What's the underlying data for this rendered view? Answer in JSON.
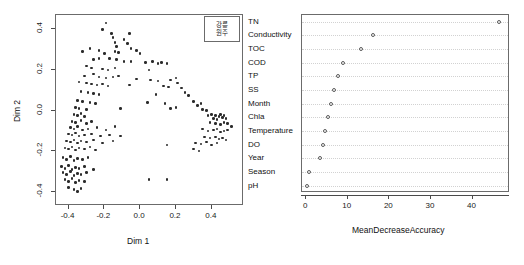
{
  "figure": {
    "background": "#ffffff",
    "point_color": "#2b2b2b",
    "frame_color": "#6b6b6b"
  },
  "chart_data": [
    {
      "type": "scatter",
      "title": "",
      "xlabel": "Dim 1",
      "ylabel": "Dim 2",
      "xlim": [
        -0.47,
        0.58
      ],
      "ylim": [
        -0.47,
        0.47
      ],
      "xticks": [
        -0.4,
        -0.2,
        0.0,
        0.2,
        0.4
      ],
      "xticklabels": [
        "-0.4",
        "-0.2",
        "0.0",
        "0.2",
        "0.4"
      ],
      "yticks": [
        -0.4,
        -0.2,
        0.0,
        0.2,
        0.4
      ],
      "yticklabels": [
        "-0.4",
        "-0.2",
        "0.0",
        "0.2",
        "0.4"
      ],
      "grid": false,
      "legend_position": "top-right",
      "legend_entries": [
        "강릉",
        "원주"
      ],
      "points": [
        [
          -0.185,
          0.425
        ],
        [
          -0.205,
          0.395
        ],
        [
          -0.155,
          0.375
        ],
        [
          -0.055,
          0.375
        ],
        [
          -0.145,
          0.355
        ],
        [
          -0.085,
          0.345
        ],
        [
          -0.135,
          0.33
        ],
        [
          -0.065,
          0.325
        ],
        [
          -0.125,
          0.31
        ],
        [
          -0.275,
          0.3
        ],
        [
          -0.315,
          0.285
        ],
        [
          -0.225,
          0.29
        ],
        [
          -0.135,
          0.285
        ],
        [
          -0.115,
          0.28
        ],
        [
          -0.195,
          0.275
        ],
        [
          -0.045,
          0.3
        ],
        [
          -0.015,
          0.29
        ],
        [
          0.005,
          0.275
        ],
        [
          -0.255,
          0.245
        ],
        [
          -0.225,
          0.25
        ],
        [
          -0.165,
          0.25
        ],
        [
          -0.125,
          0.245
        ],
        [
          -0.085,
          0.235
        ],
        [
          -0.045,
          0.235
        ],
        [
          0.035,
          0.23
        ],
        [
          0.075,
          0.235
        ],
        [
          0.105,
          0.225
        ],
        [
          0.125,
          0.23
        ],
        [
          0.155,
          0.225
        ],
        [
          -0.295,
          0.215
        ],
        [
          -0.265,
          0.205
        ],
        [
          -0.205,
          0.2
        ],
        [
          -0.175,
          0.195
        ],
        [
          -0.135,
          0.205
        ],
        [
          0.055,
          0.195
        ],
        [
          -0.305,
          0.165
        ],
        [
          -0.255,
          0.175
        ],
        [
          -0.225,
          0.16
        ],
        [
          -0.185,
          0.155
        ],
        [
          -0.145,
          0.16
        ],
        [
          -0.115,
          0.165
        ],
        [
          -0.015,
          0.15
        ],
        [
          0.065,
          0.145
        ],
        [
          0.105,
          0.14
        ],
        [
          0.175,
          0.145
        ],
        [
          0.205,
          0.155
        ],
        [
          0.215,
          0.13
        ],
        [
          -0.335,
          0.135
        ],
        [
          -0.295,
          0.13
        ],
        [
          -0.265,
          0.125
        ],
        [
          -0.235,
          0.12
        ],
        [
          -0.205,
          0.125
        ],
        [
          -0.175,
          0.115
        ],
        [
          -0.055,
          0.12
        ],
        [
          0.135,
          0.115
        ],
        [
          0.165,
          0.11
        ],
        [
          0.235,
          0.105
        ],
        [
          -0.325,
          0.09
        ],
        [
          -0.285,
          0.085
        ],
        [
          -0.255,
          0.08
        ],
        [
          -0.225,
          0.075
        ],
        [
          0.095,
          0.075
        ],
        [
          0.255,
          0.085
        ],
        [
          0.275,
          0.07
        ],
        [
          -0.345,
          0.045
        ],
        [
          -0.315,
          0.04
        ],
        [
          -0.275,
          0.035
        ],
        [
          -0.245,
          0.03
        ],
        [
          0.045,
          0.035
        ],
        [
          0.145,
          0.03
        ],
        [
          0.305,
          0.04
        ],
        [
          0.325,
          0.02
        ],
        [
          0.345,
          0.03
        ],
        [
          -0.355,
          0.01
        ],
        [
          -0.335,
          0.005
        ],
        [
          -0.295,
          0.0
        ],
        [
          -0.105,
          0.005
        ],
        [
          0.175,
          0.005
        ],
        [
          0.205,
          0.01
        ],
        [
          0.355,
          0.0
        ],
        [
          0.375,
          -0.005
        ],
        [
          -0.365,
          -0.025
        ],
        [
          -0.345,
          -0.03
        ],
        [
          -0.325,
          -0.02
        ],
        [
          -0.305,
          -0.035
        ],
        [
          0.385,
          -0.03
        ],
        [
          0.405,
          -0.025
        ],
        [
          0.425,
          -0.03
        ],
        [
          0.445,
          -0.035
        ],
        [
          0.455,
          -0.025
        ],
        [
          0.465,
          -0.04
        ],
        [
          0.475,
          -0.03
        ],
        [
          0.485,
          -0.045
        ],
        [
          0.435,
          -0.05
        ],
        [
          0.415,
          -0.045
        ],
        [
          -0.375,
          -0.06
        ],
        [
          -0.355,
          -0.065
        ],
        [
          -0.325,
          -0.055
        ],
        [
          -0.295,
          -0.07
        ],
        [
          -0.265,
          -0.06
        ],
        [
          0.395,
          -0.065
        ],
        [
          0.425,
          -0.07
        ],
        [
          0.455,
          -0.075
        ],
        [
          0.475,
          -0.065
        ],
        [
          0.495,
          -0.07
        ],
        [
          0.515,
          -0.085
        ],
        [
          -0.385,
          -0.09
        ],
        [
          -0.365,
          -0.095
        ],
        [
          -0.345,
          -0.085
        ],
        [
          -0.315,
          -0.1
        ],
        [
          -0.285,
          -0.095
        ],
        [
          -0.235,
          -0.09
        ],
        [
          -0.185,
          -0.1
        ],
        [
          -0.135,
          -0.085
        ],
        [
          0.355,
          -0.095
        ],
        [
          0.385,
          -0.105
        ],
        [
          0.415,
          -0.1
        ],
        [
          0.435,
          -0.095
        ],
        [
          0.455,
          -0.11
        ],
        [
          0.475,
          -0.105
        ],
        [
          0.495,
          -0.1
        ],
        [
          -0.395,
          -0.12
        ],
        [
          -0.375,
          -0.125
        ],
        [
          -0.355,
          -0.115
        ],
        [
          -0.335,
          -0.13
        ],
        [
          -0.305,
          -0.125
        ],
        [
          -0.265,
          -0.12
        ],
        [
          -0.215,
          -0.13
        ],
        [
          -0.165,
          -0.125
        ],
        [
          -0.105,
          -0.13
        ],
        [
          0.365,
          -0.135
        ],
        [
          0.395,
          -0.14
        ],
        [
          0.425,
          -0.135
        ],
        [
          0.445,
          -0.145
        ],
        [
          0.465,
          -0.14
        ],
        [
          0.485,
          -0.15
        ],
        [
          -0.405,
          -0.155
        ],
        [
          -0.385,
          -0.16
        ],
        [
          -0.365,
          -0.15
        ],
        [
          -0.345,
          -0.165
        ],
        [
          -0.325,
          -0.155
        ],
        [
          -0.295,
          -0.16
        ],
        [
          -0.255,
          -0.15
        ],
        [
          -0.205,
          -0.165
        ],
        [
          -0.145,
          -0.155
        ],
        [
          0.155,
          -0.175
        ],
        [
          0.315,
          -0.165
        ],
        [
          0.345,
          -0.17
        ],
        [
          0.375,
          -0.16
        ],
        [
          0.405,
          -0.175
        ],
        [
          0.435,
          -0.165
        ],
        [
          -0.415,
          -0.19
        ],
        [
          -0.395,
          -0.195
        ],
        [
          -0.375,
          -0.185
        ],
        [
          -0.355,
          -0.2
        ],
        [
          -0.335,
          -0.19
        ],
        [
          -0.305,
          -0.195
        ],
        [
          -0.275,
          -0.185
        ],
        [
          -0.245,
          -0.2
        ],
        [
          0.305,
          -0.195
        ],
        [
          0.335,
          -0.205
        ],
        [
          -0.425,
          -0.235
        ],
        [
          -0.405,
          -0.245
        ],
        [
          -0.385,
          -0.23
        ],
        [
          -0.365,
          -0.25
        ],
        [
          -0.345,
          -0.24
        ],
        [
          -0.315,
          -0.245
        ],
        [
          -0.285,
          -0.235
        ],
        [
          -0.435,
          -0.28
        ],
        [
          -0.415,
          -0.29
        ],
        [
          -0.395,
          -0.275
        ],
        [
          -0.375,
          -0.295
        ],
        [
          -0.355,
          -0.285
        ],
        [
          -0.335,
          -0.29
        ],
        [
          -0.305,
          -0.28
        ],
        [
          -0.255,
          -0.295
        ],
        [
          -0.425,
          -0.31
        ],
        [
          -0.405,
          -0.32
        ],
        [
          -0.385,
          -0.305
        ],
        [
          -0.365,
          -0.325
        ],
        [
          -0.345,
          -0.315
        ],
        [
          -0.325,
          -0.32
        ],
        [
          -0.295,
          -0.31
        ],
        [
          0.055,
          -0.345
        ],
        [
          0.155,
          -0.345
        ],
        [
          -0.415,
          -0.345
        ],
        [
          -0.395,
          -0.355
        ],
        [
          -0.375,
          -0.34
        ],
        [
          -0.355,
          -0.36
        ],
        [
          -0.335,
          -0.35
        ],
        [
          -0.305,
          -0.355
        ],
        [
          -0.395,
          -0.385
        ],
        [
          -0.365,
          -0.395
        ],
        [
          -0.345,
          -0.405
        ],
        [
          -0.325,
          -0.39
        ]
      ]
    },
    {
      "type": "dotplot",
      "title": "",
      "xlabel": "MeanDecreaseAccuracy",
      "ylabel": "",
      "xlim": [
        -1.0,
        49.0
      ],
      "xticks": [
        0,
        10,
        20,
        30,
        40
      ],
      "xticklabels": [
        "0",
        "10",
        "20",
        "30",
        "40"
      ],
      "grid": "dotted-horizontal",
      "categories": [
        "TN",
        "Conductivity",
        "TOC",
        "COD",
        "TP",
        "SS",
        "Month",
        "Chla",
        "Temperature",
        "DO",
        "Year",
        "Season",
        "pH"
      ],
      "values": [
        46.7,
        16.4,
        13.5,
        9.2,
        7.8,
        6.9,
        6.2,
        5.4,
        4.7,
        4.2,
        3.5,
        1.0,
        0.4
      ]
    }
  ]
}
